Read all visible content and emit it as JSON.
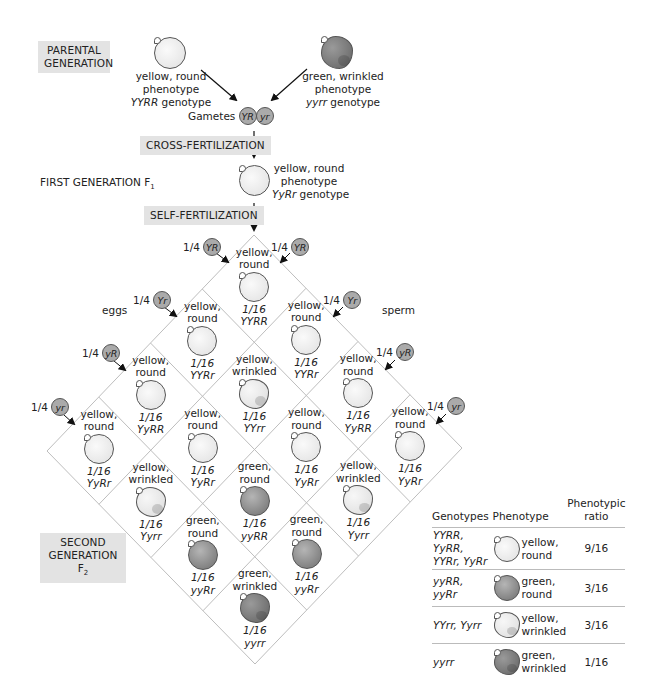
{
  "parental": {
    "label_line1": "PARENTAL",
    "label_line2": "GENERATION",
    "left_parent": {
      "phenotype_line1": "yellow, round",
      "phenotype_line2": "phenotype",
      "genotype": "YYRR",
      "genotype_suffix": " genotype",
      "pea": "yellow-round"
    },
    "right_parent": {
      "phenotype_line1": "green, wrinkled",
      "phenotype_line2": "phenotype",
      "genotype": "yyrr",
      "genotype_suffix": " genotype",
      "pea": "green-wrinkled"
    }
  },
  "gametes": {
    "label": "Gametes",
    "alleles": [
      "YR",
      "yr"
    ]
  },
  "cross_fertilization": {
    "label": "CROSS-FERTILIZATION"
  },
  "first_generation": {
    "label": "FIRST GENERATION F",
    "subscript": "1",
    "phenotype_line1": "yellow, round",
    "phenotype_line2": "phenotype",
    "genotype": "YyRr",
    "genotype_suffix": " genotype"
  },
  "self_fertilization": {
    "label": "SELF-FERTILIZATION"
  },
  "punnett": {
    "eggs_label": "eggs",
    "sperm_label": "sperm",
    "egg_gametes": [
      {
        "fraction": "1/4",
        "allele": "YR"
      },
      {
        "fraction": "1/4",
        "allele": "Yr"
      },
      {
        "fraction": "1/4",
        "allele": "yR"
      },
      {
        "fraction": "1/4",
        "allele": "yr"
      }
    ],
    "sperm_gametes": [
      {
        "fraction": "1/4",
        "allele": "YR"
      },
      {
        "fraction": "1/4",
        "allele": "Yr"
      },
      {
        "fraction": "1/4",
        "allele": "yR"
      },
      {
        "fraction": "1/4",
        "allele": "yr"
      }
    ],
    "cells": [
      [
        {
          "line1": "yellow,",
          "line2": "round",
          "fraction": "1/16",
          "genotype": "YYRR",
          "pea": "yr"
        },
        {
          "line1": "yellow,",
          "line2": "round",
          "fraction": "1/16",
          "genotype": "YYRr",
          "pea": "yr"
        },
        {
          "line1": "yellow,",
          "line2": "round",
          "fraction": "1/16",
          "genotype": "YyRR",
          "pea": "yr"
        },
        {
          "line1": "yellow,",
          "line2": "round",
          "fraction": "1/16",
          "genotype": "YyRr",
          "pea": "yr"
        }
      ],
      [
        {
          "line1": "yellow,",
          "line2": "round",
          "fraction": "1/16",
          "genotype": "YYRr",
          "pea": "yr"
        },
        {
          "line1": "yellow,",
          "line2": "wrinkled",
          "fraction": "1/16",
          "genotype": "YYrr",
          "pea": "yw"
        },
        {
          "line1": "yellow,",
          "line2": "round",
          "fraction": "1/16",
          "genotype": "YyRr",
          "pea": "yr"
        },
        {
          "line1": "yellow,",
          "line2": "wrinkled",
          "fraction": "1/16",
          "genotype": "Yyrr",
          "pea": "yw"
        }
      ],
      [
        {
          "line1": "yellow,",
          "line2": "round",
          "fraction": "1/16",
          "genotype": "YyRR",
          "pea": "yr"
        },
        {
          "line1": "yellow,",
          "line2": "round",
          "fraction": "1/16",
          "genotype": "YyRr",
          "pea": "yr"
        },
        {
          "line1": "green,",
          "line2": "round",
          "fraction": "1/16",
          "genotype": "yyRR",
          "pea": "gr"
        },
        {
          "line1": "green,",
          "line2": "round",
          "fraction": "1/16",
          "genotype": "yyRr",
          "pea": "gr"
        }
      ],
      [
        {
          "line1": "yellow,",
          "line2": "round",
          "fraction": "1/16",
          "genotype": "YyRr",
          "pea": "yr"
        },
        {
          "line1": "yellow,",
          "line2": "wrinkled",
          "fraction": "1/16",
          "genotype": "Yyrr",
          "pea": "yw"
        },
        {
          "line1": "green,",
          "line2": "round",
          "fraction": "1/16",
          "genotype": "yyRr",
          "pea": "gr"
        },
        {
          "line1": "green,",
          "line2": "wrinkled",
          "fraction": "1/16",
          "genotype": "yyrr",
          "pea": "gw"
        }
      ]
    ]
  },
  "second_generation": {
    "label_line1": "SECOND",
    "label_line2": "GENERATION F",
    "subscript": "2"
  },
  "summary_table": {
    "headers": {
      "genotypes": "Genotypes",
      "phenotype": "Phenotype",
      "ratio_line1": "Phenotypic",
      "ratio_line2": "ratio"
    },
    "rows": [
      {
        "genotypes_line1": "YYRR, YyRR,",
        "genotypes_line2": "YYRr, YyRr",
        "phenotype_line1": "yellow,",
        "phenotype_line2": "round",
        "ratio": "9/16",
        "pea": "yr"
      },
      {
        "genotypes_line1": "yyRR, yyRr",
        "genotypes_line2": "",
        "phenotype_line1": "green,",
        "phenotype_line2": "round",
        "ratio": "3/16",
        "pea": "gr"
      },
      {
        "genotypes_line1": "YYrr, Yyrr",
        "genotypes_line2": "",
        "phenotype_line1": "yellow,",
        "phenotype_line2": "wrinkled",
        "ratio": "3/16",
        "pea": "yw"
      },
      {
        "genotypes_line1": "yyrr",
        "genotypes_line2": "",
        "phenotype_line1": "green,",
        "phenotype_line2": "wrinkled",
        "ratio": "1/16",
        "pea": "gw"
      }
    ]
  }
}
